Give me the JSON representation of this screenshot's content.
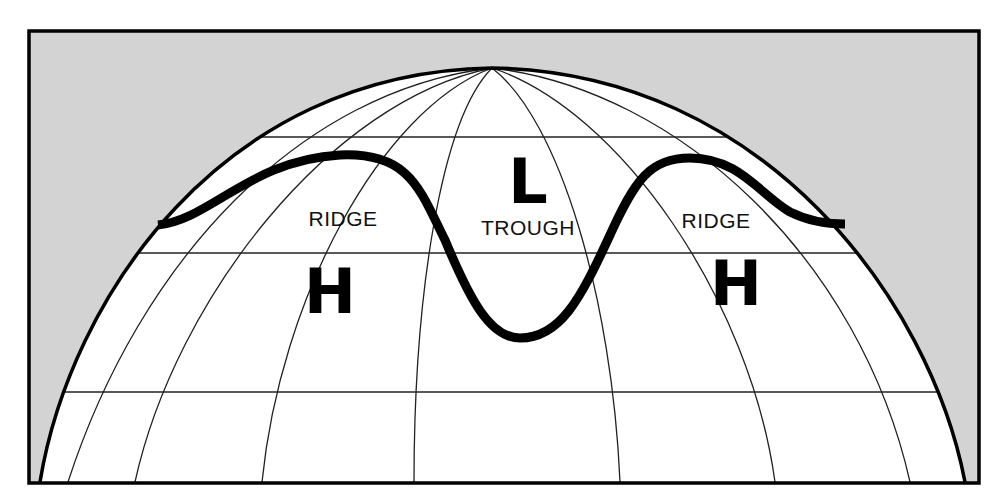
{
  "diagram": {
    "title": "",
    "colors": {
      "background_fill": "#d3d3d3",
      "globe_fill": "#ffffff",
      "frame_stroke": "#000000",
      "grid_stroke": "#222222",
      "jet_stream_stroke": "#000000"
    },
    "labels": {
      "ridge_left": "RIDGE",
      "trough": "TROUGH",
      "ridge_right": "RIDGE",
      "high_left": "H",
      "low_center": "L",
      "high_right": "H"
    },
    "elements": [
      {
        "id": "frame",
        "type": "rectangle"
      },
      {
        "id": "globe-dome",
        "type": "arc"
      },
      {
        "id": "latitude-lines",
        "count": 3
      },
      {
        "id": "meridian-lines",
        "count": 7
      },
      {
        "id": "jet-stream-line",
        "type": "wave",
        "features": [
          "ridge",
          "trough",
          "ridge"
        ]
      }
    ]
  }
}
